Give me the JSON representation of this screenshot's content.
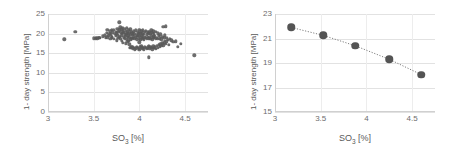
{
  "figure": {
    "background": "#ffffff",
    "marker_color": "#595959",
    "gridline_color": "#e2e2e2",
    "trendline_color": "#7f7f7f"
  },
  "charts": [
    {
      "id": "chart-left",
      "panel_name": "scatter-panel",
      "xlabel_main": "SO",
      "xlabel_sub": "3",
      "xlabel_unit": " [%]",
      "ylabel": "1- day strength [MPa]",
      "yticks": [
        "0",
        "5",
        "10",
        "15",
        "20",
        "25"
      ],
      "xticks": [
        "3",
        "3.5",
        "4",
        "4.5"
      ]
    },
    {
      "id": "chart-right",
      "panel_name": "trend-panel",
      "xlabel_main": "SO",
      "xlabel_sub": "3",
      "xlabel_unit": " [%]",
      "ylabel": "1- day strength [MPa]",
      "yticks": [
        "15",
        "17",
        "19",
        "21",
        "23"
      ],
      "xticks": [
        "3",
        "3.5",
        "4",
        "4.5"
      ]
    }
  ],
  "chart_data": [
    {
      "type": "scatter",
      "panel": "left",
      "title": "",
      "xlabel": "SO3 [%]",
      "ylabel": "1- day strength [MPa]",
      "xlim": [
        3,
        4.75
      ],
      "ylim": [
        0,
        25
      ],
      "xticks": [
        3,
        3.5,
        4,
        4.5
      ],
      "yticks": [
        0,
        5,
        10,
        15,
        20,
        25
      ],
      "grid": true,
      "legend": "none",
      "marker": "filled-circle",
      "marker_color": "#595959",
      "n_points": 196,
      "x": [
        3.18,
        3.3,
        3.5,
        3.52,
        3.54,
        3.56,
        3.6,
        3.62,
        3.63,
        3.64,
        3.65,
        3.65,
        3.66,
        3.67,
        3.68,
        3.68,
        3.69,
        3.7,
        3.7,
        3.71,
        3.72,
        3.72,
        3.73,
        3.74,
        3.74,
        3.75,
        3.75,
        3.76,
        3.76,
        3.77,
        3.77,
        3.78,
        3.78,
        3.78,
        3.79,
        3.79,
        3.8,
        3.8,
        3.8,
        3.81,
        3.81,
        3.82,
        3.82,
        3.82,
        3.83,
        3.83,
        3.84,
        3.84,
        3.84,
        3.85,
        3.85,
        3.85,
        3.86,
        3.86,
        3.86,
        3.87,
        3.87,
        3.87,
        3.88,
        3.88,
        3.88,
        3.89,
        3.89,
        3.89,
        3.9,
        3.9,
        3.9,
        3.9,
        3.91,
        3.91,
        3.91,
        3.92,
        3.92,
        3.92,
        3.93,
        3.93,
        3.93,
        3.94,
        3.94,
        3.94,
        3.95,
        3.95,
        3.95,
        3.96,
        3.96,
        3.96,
        3.97,
        3.97,
        3.97,
        3.98,
        3.98,
        3.98,
        3.99,
        3.99,
        3.99,
        4.0,
        4.0,
        4.0,
        4.0,
        4.01,
        4.01,
        4.01,
        4.02,
        4.02,
        4.02,
        4.03,
        4.03,
        4.03,
        4.04,
        4.04,
        4.04,
        4.05,
        4.05,
        4.05,
        4.06,
        4.06,
        4.06,
        4.07,
        4.07,
        4.07,
        4.08,
        4.08,
        4.08,
        4.09,
        4.09,
        4.09,
        4.1,
        4.1,
        4.1,
        4.1,
        4.11,
        4.11,
        4.11,
        4.12,
        4.12,
        4.12,
        4.13,
        4.13,
        4.13,
        4.14,
        4.14,
        4.14,
        4.15,
        4.15,
        4.15,
        4.16,
        4.16,
        4.16,
        4.17,
        4.17,
        4.18,
        4.18,
        4.18,
        4.19,
        4.19,
        4.2,
        4.2,
        4.2,
        4.21,
        4.21,
        4.22,
        4.22,
        4.23,
        4.23,
        4.24,
        4.24,
        4.25,
        4.25,
        4.26,
        4.26,
        4.27,
        4.27,
        4.28,
        4.28,
        4.29,
        4.29,
        4.3,
        4.3,
        4.31,
        4.32,
        4.33,
        4.35,
        4.37,
        4.4,
        4.42,
        4.45,
        4.6,
        3.52,
        3.56,
        3.7,
        3.86,
        4.02,
        4.16
      ],
      "y": [
        18.5,
        20.4,
        18.8,
        18.9,
        18.8,
        19.0,
        19.3,
        19.6,
        18.9,
        20.2,
        19.1,
        21.0,
        19.5,
        20.0,
        18.6,
        20.6,
        19.8,
        19.2,
        20.9,
        20.3,
        18.7,
        21.0,
        19.9,
        19.4,
        20.5,
        18.3,
        20.1,
        19.7,
        21.3,
        18.9,
        20.4,
        19.2,
        20.8,
        22.9,
        18.6,
        21.6,
        19.5,
        20.2,
        21.1,
        18.2,
        19.9,
        20.6,
        21.4,
        17.7,
        19.1,
        20.3,
        18.8,
        19.8,
        21.2,
        17.5,
        19.4,
        20.7,
        18.5,
        20.0,
        21.5,
        17.9,
        19.2,
        20.4,
        18.1,
        19.6,
        20.9,
        17.3,
        18.9,
        20.2,
        16.3,
        18.4,
        19.7,
        21.1,
        16.5,
        19.0,
        20.5,
        16.7,
        18.6,
        20.1,
        16.1,
        18.9,
        19.8,
        16.4,
        19.3,
        20.6,
        16.0,
        18.7,
        20.0,
        16.2,
        19.1,
        20.8,
        16.6,
        18.5,
        19.6,
        16.3,
        19.4,
        20.3,
        16.1,
        18.8,
        20.1,
        15.9,
        17.8,
        19.5,
        20.9,
        16.5,
        18.4,
        20.2,
        16.8,
        19.0,
        20.6,
        16.2,
        18.7,
        19.9,
        16.4,
        19.3,
        20.8,
        16.0,
        18.5,
        20.0,
        16.7,
        19.1,
        20.4,
        16.3,
        18.9,
        20.7,
        16.1,
        18.6,
        19.8,
        16.5,
        19.2,
        20.3,
        14.0,
        16.9,
        18.8,
        20.1,
        16.2,
        19.0,
        20.5,
        16.6,
        18.7,
        19.9,
        16.4,
        19.4,
        20.8,
        16.0,
        18.5,
        20.2,
        16.8,
        19.1,
        20.6,
        16.3,
        18.9,
        20.0,
        16.5,
        19.3,
        16.1,
        18.7,
        20.4,
        16.9,
        19.0,
        16.4,
        18.6,
        20.1,
        17.1,
        19.5,
        16.7,
        18.8,
        17.3,
        19.8,
        16.9,
        18.5,
        17.5,
        19.2,
        17.0,
        21.8,
        17.6,
        18.9,
        18.2,
        19.6,
        17.4,
        21.9,
        18.0,
        19.0,
        18.4,
        17.2,
        18.6,
        18.3,
        17.9,
        18.0,
        16.7,
        17.4,
        14.5,
        18.7,
        19.0,
        19.1,
        20.1,
        19.6,
        19.4,
        19.0
      ]
    },
    {
      "type": "line",
      "panel": "right",
      "title": "",
      "xlabel": "SO3 [%]",
      "ylabel": "1- day strength [MPa]",
      "xlim": [
        3,
        4.75
      ],
      "ylim": [
        15,
        23
      ],
      "xticks": [
        3,
        3.5,
        4,
        4.5
      ],
      "yticks": [
        15,
        17,
        19,
        21,
        23
      ],
      "grid": true,
      "legend": "none",
      "marker": "filled-circle",
      "marker_color": "#545454",
      "linestyle": "dotted",
      "x": [
        3.18,
        3.53,
        3.88,
        4.25,
        4.6
      ],
      "y": [
        21.9,
        21.25,
        20.4,
        19.3,
        18.05
      ]
    }
  ]
}
